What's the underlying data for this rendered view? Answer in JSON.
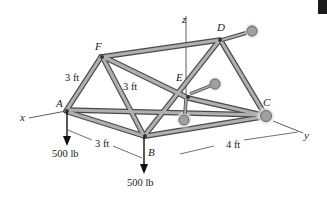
{
  "figure": {
    "type": "space truss",
    "joints": {
      "A": {
        "label": "A"
      },
      "B": {
        "label": "B"
      },
      "C": {
        "label": "C"
      },
      "D": {
        "label": "D"
      },
      "E": {
        "label": "E"
      },
      "F": {
        "label": "F"
      }
    },
    "axes": {
      "x": "x",
      "y": "y",
      "z": "z"
    },
    "dimensions": {
      "AF": "3 ft",
      "FB": "3 ft",
      "AB": "3 ft",
      "BC": "4 ft"
    },
    "loads": {
      "A": "500 lb",
      "B": "500 lb"
    },
    "colors": {
      "member_fill": "#a8a8a8",
      "member_edge": "#4a4a4a",
      "support": "#9a9a9a",
      "text": "#222222"
    }
  }
}
